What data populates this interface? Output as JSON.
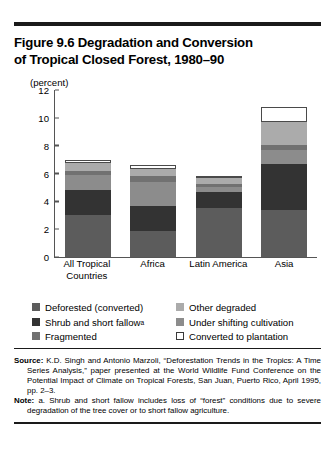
{
  "title": {
    "line1": "Figure 9.6  Degradation and Conversion",
    "line2": "of Tropical Closed Forest, 1980–90"
  },
  "axis_unit": "(percent)",
  "legend": [
    {
      "label": "Deforested (converted)",
      "color": "#5c5c5c",
      "outline": false
    },
    {
      "label": "Other degraded",
      "color": "#ababab",
      "outline": false
    },
    {
      "label": "Shrub and short fallow",
      "note_marker": "a",
      "color": "#333333",
      "outline": false
    },
    {
      "label": "Under shifting cultivation",
      "color": "#8c8c8c",
      "outline": false
    },
    {
      "label": "Fragmented",
      "color": "#717171",
      "outline": false
    },
    {
      "label": "Converted to plantation",
      "color": "#ffffff",
      "outline": true
    }
  ],
  "source": {
    "label": "Source:",
    "text": "K.D. Singh and Antonio Marzoli, “Deforestation Trends in the Tropics: A Time Series Analysis,” paper presented at the World Wildlife Fund Conference on the Potential Impact of Climate on Tropical Forests, San Juan, Puerto Rico, April 1995, pp. 2–3."
  },
  "note": {
    "label": "Note:",
    "text": "a. Shrub and short fallow includes loss of “forest” conditions due to severe degradation of the tree cover or to short fallow agriculture."
  },
  "chart_data": {
    "type": "bar",
    "stacked": true,
    "title": "Figure 9.6  Degradation and Conversion of Tropical Closed Forest, 1980–90",
    "xlabel": "",
    "ylabel": "(percent)",
    "ylim": [
      0,
      12
    ],
    "yticks": [
      0,
      2,
      4,
      6,
      8,
      10,
      12
    ],
    "grid": false,
    "legend_position": "below",
    "categories": [
      "All Tropical Countries",
      "Africa",
      "Latin America",
      "Asia"
    ],
    "series": [
      {
        "name": "Deforested (converted)",
        "color": "#5c5c5c",
        "values": [
          3.0,
          1.9,
          3.5,
          3.4
        ]
      },
      {
        "name": "Shrub and short fallow",
        "color": "#333333",
        "values": [
          1.8,
          1.8,
          1.2,
          3.3
        ]
      },
      {
        "name": "Under shifting cultivation",
        "color": "#8c8c8c",
        "values": [
          1.1,
          1.7,
          0.3,
          1.0
        ]
      },
      {
        "name": "Fragmented",
        "color": "#717171",
        "values": [
          0.3,
          0.45,
          0.25,
          0.35
        ]
      },
      {
        "name": "Other degraded",
        "color": "#ababab",
        "values": [
          0.55,
          0.5,
          0.4,
          1.65
        ]
      },
      {
        "name": "Converted to plantation",
        "color": "#ffffff",
        "values": [
          0.25,
          0.25,
          0.15,
          1.1
        ]
      }
    ],
    "totals": [
      7.0,
      6.6,
      5.8,
      10.8
    ]
  }
}
